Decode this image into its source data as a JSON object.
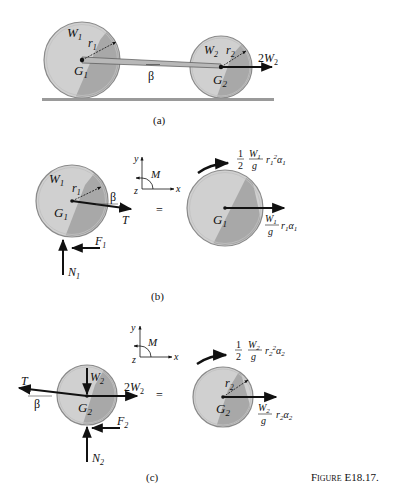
{
  "figure": {
    "caption": "FIGURE E18.17.",
    "caption_prefix": "Figure",
    "caption_number": "E18.17."
  },
  "panels": {
    "a": {
      "label": "(a)",
      "wheel1": {
        "weight": "W",
        "weight_sub": "1",
        "radius": "r",
        "radius_sub": "1",
        "center": "G",
        "center_sub": "1"
      },
      "wheel2": {
        "weight": "W",
        "weight_sub": "2",
        "radius": "r",
        "radius_sub": "2",
        "center": "G",
        "center_sub": "2"
      },
      "angle": "β",
      "force": {
        "coef": "2",
        "sym": "W",
        "sub": "2"
      }
    },
    "b": {
      "label": "(b)",
      "axes": {
        "x": "x",
        "y": "y",
        "z": "z",
        "moment": "M"
      },
      "equals": "=",
      "fbd": {
        "weight": "W",
        "weight_sub": "1",
        "radius": "r",
        "radius_sub": "1",
        "center": "G",
        "center_sub": "1",
        "angle": "β",
        "tension": "T",
        "friction": "F",
        "friction_sub": "1",
        "normal": "N",
        "normal_sub": "1"
      },
      "kd": {
        "moment": {
          "half_num": "1",
          "half_den": "2",
          "w": "W",
          "w_sub": "1",
          "g": "g",
          "r": "r",
          "r_sub": "1",
          "r_exp": "2",
          "alpha": "α",
          "alpha_sub": "1"
        },
        "center": "G",
        "center_sub": "1",
        "force": {
          "w": "W",
          "w_sub": "1",
          "g": "g",
          "r": "r",
          "r_sub": "1",
          "alpha": "α",
          "alpha_sub": "1"
        }
      }
    },
    "c": {
      "label": "(c)",
      "axes": {
        "x": "x",
        "y": "y",
        "z": "z",
        "moment": "M"
      },
      "equals": "=",
      "fbd": {
        "weight": "W",
        "weight_sub": "2",
        "center": "G",
        "center_sub": "2",
        "angle": "β",
        "tension": "T",
        "applied_coef": "2",
        "applied": "W",
        "applied_sub": "2",
        "friction": "F",
        "friction_sub": "2",
        "normal": "N",
        "normal_sub": "2"
      },
      "kd": {
        "moment": {
          "half_num": "1",
          "half_den": "2",
          "w": "W",
          "w_sub": "2",
          "g": "g",
          "r": "r",
          "r_sub": "2",
          "r_exp": "2",
          "alpha": "α",
          "alpha_sub": "2"
        },
        "radius": "r",
        "radius_sub": "2",
        "center": "G",
        "center_sub": "2",
        "force": {
          "w": "W",
          "w_sub": "2",
          "g": "g",
          "r": "r",
          "r_sub": "2",
          "alpha": "α",
          "alpha_sub": "2"
        }
      }
    }
  },
  "colors": {
    "wheel_light": "#d4d4d4",
    "wheel_dark": "#a9a9a9",
    "rim": "#8a8a8a",
    "ink": "#111111",
    "ground": "#9a9a9a"
  }
}
